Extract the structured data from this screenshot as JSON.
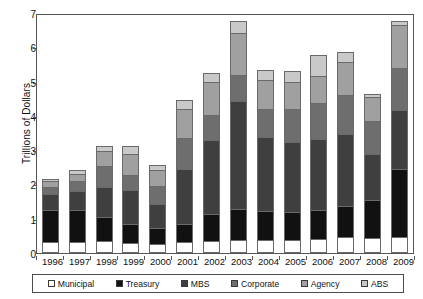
{
  "chart_data": {
    "type": "bar",
    "stacked": true,
    "title": "",
    "xlabel": "",
    "ylabel": "Trillions of Dollars",
    "ylim": [
      0,
      7
    ],
    "yticks": [
      0,
      1,
      2,
      3,
      4,
      5,
      6,
      7
    ],
    "grid": false,
    "legend_position": "bottom",
    "categories": [
      "1996",
      "1997",
      "1998",
      "1999",
      "2000",
      "2001",
      "2002",
      "2003",
      "2004",
      "2005",
      "2006",
      "2007",
      "2008",
      "2009"
    ],
    "series": [
      {
        "name": "Municipal",
        "color": "#ffffff",
        "values": [
          0.25,
          0.25,
          0.28,
          0.23,
          0.21,
          0.25,
          0.28,
          0.32,
          0.33,
          0.33,
          0.36,
          0.41,
          0.39,
          0.4
        ]
      },
      {
        "name": "Treasury",
        "color": "#111111",
        "values": [
          0.95,
          0.95,
          0.7,
          0.55,
          0.45,
          0.55,
          0.8,
          0.9,
          0.85,
          0.8,
          0.85,
          0.9,
          1.1,
          2.0
        ]
      },
      {
        "name": "MBS",
        "color": "#3f3f3f",
        "values": [
          0.45,
          0.55,
          0.9,
          1.0,
          0.7,
          1.6,
          2.15,
          3.15,
          2.15,
          2.05,
          2.05,
          2.1,
          1.35,
          1.7
        ]
      },
      {
        "name": "Corporate",
        "color": "#6e6e6e",
        "values": [
          0.22,
          0.28,
          0.6,
          0.45,
          0.55,
          0.9,
          0.75,
          0.75,
          0.8,
          0.95,
          1.05,
          1.15,
          0.95,
          1.25
        ]
      },
      {
        "name": "Agency",
        "color": "#a0a0a0",
        "values": [
          0.16,
          0.22,
          0.45,
          0.6,
          0.45,
          0.85,
          0.95,
          1.25,
          0.85,
          0.8,
          0.8,
          0.95,
          0.7,
          1.25
        ]
      },
      {
        "name": "ABS",
        "color": "#c9c9c9",
        "values": [
          0.07,
          0.1,
          0.12,
          0.22,
          0.14,
          0.25,
          0.27,
          0.33,
          0.3,
          0.32,
          0.6,
          0.3,
          0.1,
          0.1
        ]
      }
    ],
    "totals": [
      2.1,
      2.35,
      3.05,
      3.05,
      2.5,
      4.4,
      5.2,
      6.7,
      5.28,
      5.25,
      5.71,
      5.81,
      4.59,
      6.7
    ]
  },
  "axis": {
    "y_title": "Trillions of Dollars"
  }
}
